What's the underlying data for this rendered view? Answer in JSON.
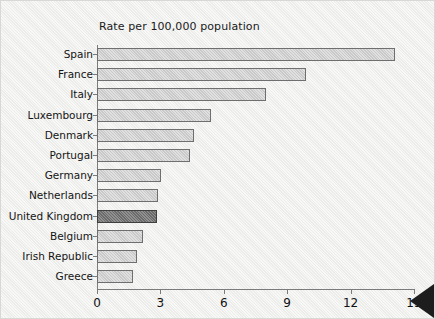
{
  "chart_data": {
    "type": "bar",
    "orientation": "horizontal",
    "title": "Rate per 100,000 population",
    "xlabel": "",
    "ylabel": "",
    "xlim": [
      0,
      15
    ],
    "xticks": [
      0,
      3,
      6,
      9,
      12,
      15
    ],
    "grid": false,
    "legend": "none",
    "highlight_category": "United Kingdom",
    "categories": [
      "Spain",
      "France",
      "Italy",
      "Luxembourg",
      "Denmark",
      "Portugal",
      "Germany",
      "Netherlands",
      "United Kingdom",
      "Belgium",
      "Irish Republic",
      "Greece"
    ],
    "values": [
      14.1,
      9.9,
      8.0,
      5.4,
      4.6,
      4.4,
      3.05,
      2.9,
      2.85,
      2.2,
      1.9,
      1.7
    ],
    "bars": [
      {
        "label": "Spain",
        "value": 14.1,
        "style": "normal"
      },
      {
        "label": "France",
        "value": 9.9,
        "style": "normal"
      },
      {
        "label": "Italy",
        "value": 8.0,
        "style": "normal"
      },
      {
        "label": "Luxembourg",
        "value": 5.4,
        "style": "normal"
      },
      {
        "label": "Denmark",
        "value": 4.6,
        "style": "normal"
      },
      {
        "label": "Portugal",
        "value": 4.4,
        "style": "normal"
      },
      {
        "label": "Germany",
        "value": 3.05,
        "style": "normal"
      },
      {
        "label": "Netherlands",
        "value": 2.9,
        "style": "normal"
      },
      {
        "label": "United Kingdom",
        "value": 2.85,
        "style": "highlight"
      },
      {
        "label": "Belgium",
        "value": 2.2,
        "style": "normal"
      },
      {
        "label": "Irish Republic",
        "value": 1.9,
        "style": "normal"
      },
      {
        "label": "Greece",
        "value": 1.7,
        "style": "normal"
      }
    ],
    "colors": {
      "bar_fill": "#cfcfcf",
      "bar_edge": "#6f6f6f",
      "highlight_fill": "#777777",
      "highlight_edge": "#3f3f3f",
      "axis": "#7b7b7b",
      "text": "#141414",
      "background": "#efefed",
      "marker": "#1d1d1d"
    }
  },
  "marker": {
    "name": "left-pointing-triangle"
  }
}
